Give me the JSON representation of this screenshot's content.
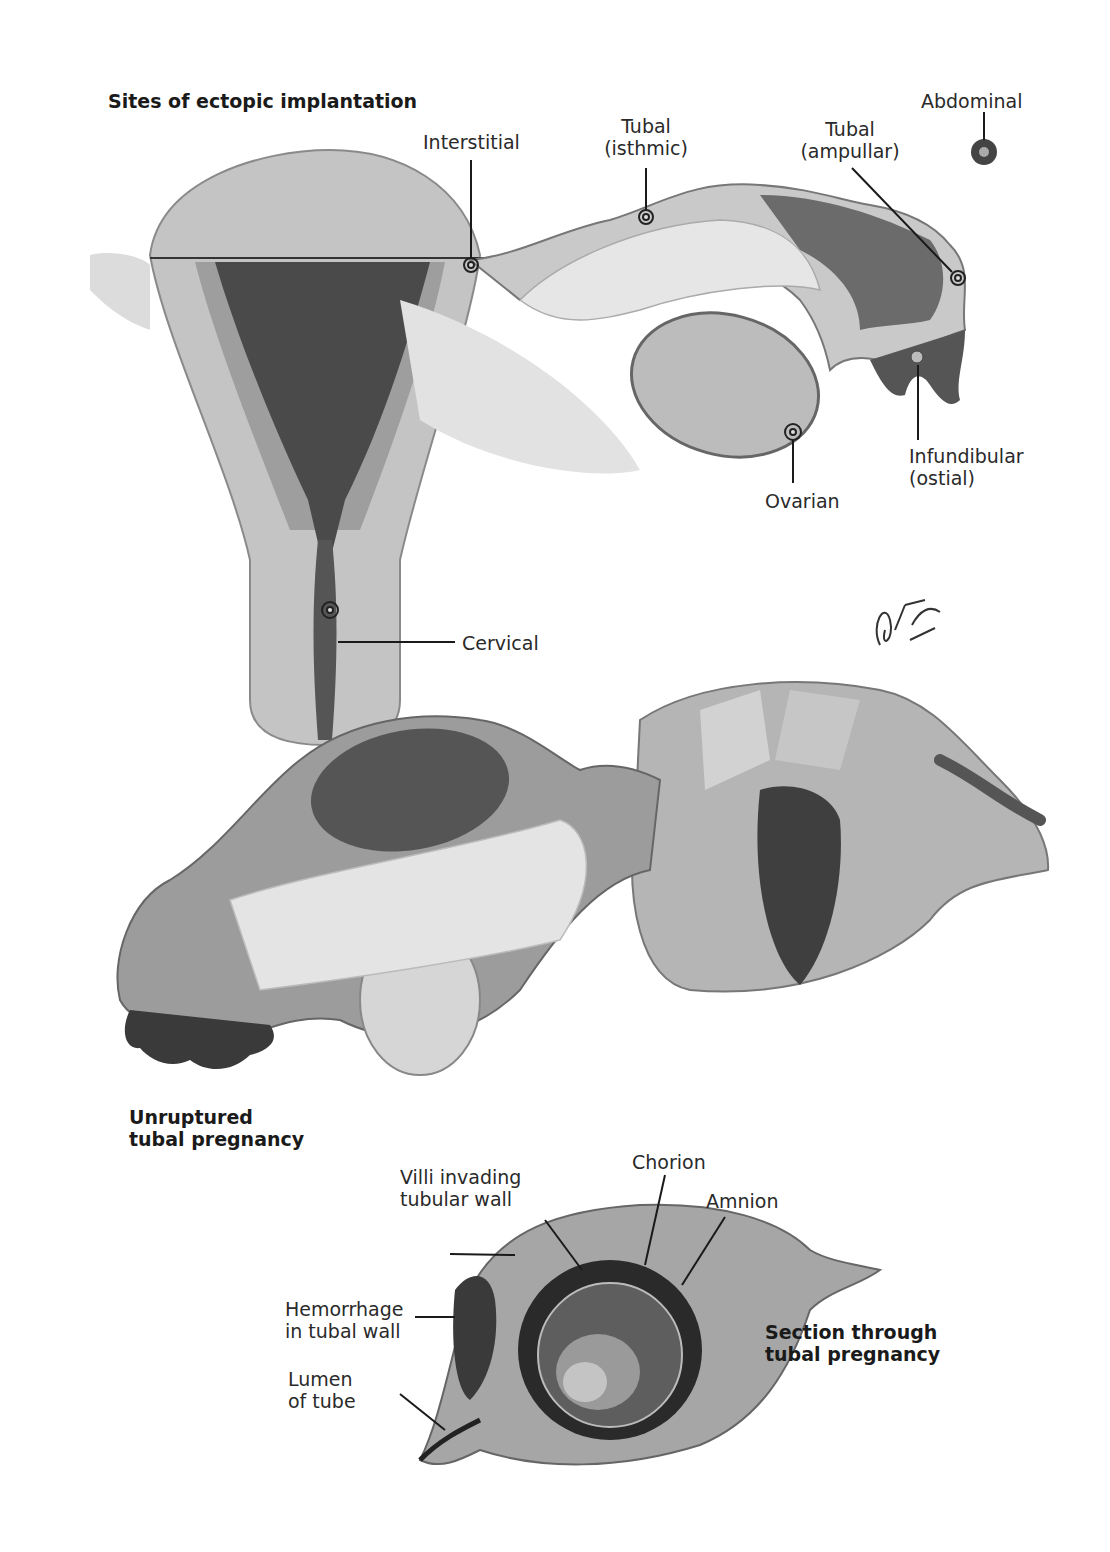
{
  "figure": {
    "panels": [
      {
        "title": "Sites of ectopic implantation",
        "labels": {
          "interstitial": "Interstitial",
          "tubal_isthmic": "Tubal\n(isthmic)",
          "tubal_ampullar": "Tubal\n(ampullar)",
          "abdominal": "Abdominal",
          "infundibular": "Infundibular\n(ostial)",
          "ovarian": "Ovarian",
          "cervical": "Cervical"
        }
      },
      {
        "title": "Unruptured\ntubal pregnancy"
      },
      {
        "title": "Section through\ntubal pregnancy",
        "labels": {
          "villi": "Villi invading\ntubular wall",
          "chorion": "Chorion",
          "amnion": "Amnion",
          "hemorrhage": "Hemorrhage\nin tubal wall",
          "lumen": "Lumen\nof tube"
        }
      }
    ],
    "signature": "F. Netter M.D."
  },
  "colors": {
    "tissue_light": "#c9c9c9",
    "tissue_mid": "#a9a9a9",
    "tissue_dark": "#4a4a4a",
    "line": "#1a1a1a"
  }
}
